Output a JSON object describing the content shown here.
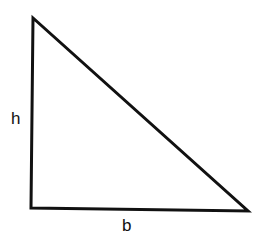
{
  "diagram": {
    "type": "right-triangle",
    "stroke_color": "#111111",
    "stroke_width": 3,
    "fill_color": "#ffffff",
    "vertices": {
      "top": [
        33,
        18
      ],
      "bottom_left": [
        31,
        208
      ],
      "bottom_right": [
        248,
        211
      ]
    },
    "labels": {
      "height": "h",
      "base": "b"
    }
  }
}
